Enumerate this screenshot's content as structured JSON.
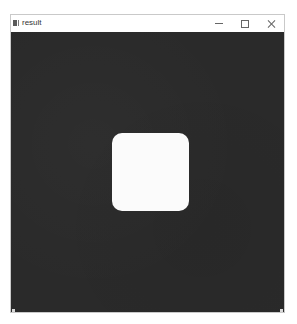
{
  "window": {
    "title": "result",
    "icon": "app-icon",
    "controls": {
      "minimize_icon": "minimize-icon",
      "maximize_icon": "maximize-icon",
      "close_icon": "close-icon"
    }
  },
  "canvas": {
    "background_color": "#2a2a2a",
    "shape": {
      "type": "rounded-square",
      "fill_color": "#fbfbfb"
    }
  }
}
